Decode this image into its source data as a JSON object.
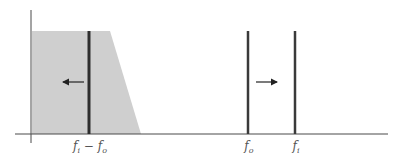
{
  "diagram": {
    "type": "frequency-spectrum",
    "colors": {
      "axis": "#4a4a4a",
      "shaded_region": "#cfcfcf",
      "lines": "#3a3a3a",
      "arrows": "#222222",
      "labels": "#555555"
    },
    "axes": {
      "x_axis": {
        "y": 134,
        "x_start": 15,
        "x_end": 388
      },
      "y_axis": {
        "x": 31,
        "y_start": 10,
        "y_end": 143
      }
    },
    "shaded_region": {
      "shape": "trapezoid",
      "points": [
        [
          32,
          31
        ],
        [
          110,
          31
        ],
        [
          141,
          134
        ],
        [
          32,
          134
        ]
      ]
    },
    "lines": [
      {
        "id": "difference",
        "x": 89,
        "label_base": "f",
        "label_sub1": "i",
        "label_op": " − ",
        "label_base2": "f",
        "label_sub2": "o"
      },
      {
        "id": "fo",
        "x": 248,
        "label_base": "f",
        "label_sub1": "o"
      },
      {
        "id": "fi",
        "x": 295,
        "label_base": "f",
        "label_sub1": "i"
      }
    ],
    "arrows": [
      {
        "id": "arrow-left",
        "direction": "left",
        "from_x": 84,
        "to_x": 63,
        "y": 82
      },
      {
        "id": "arrow-right",
        "direction": "right",
        "from_x": 256,
        "to_x": 277,
        "y": 82
      }
    ]
  },
  "labels": {
    "diff": {
      "f1": "f",
      "s1": "i",
      "op": " − ",
      "f2": "f",
      "s2": "o"
    },
    "fo": {
      "f": "f",
      "s": "o"
    },
    "fi": {
      "f": "f",
      "s": "i"
    }
  }
}
